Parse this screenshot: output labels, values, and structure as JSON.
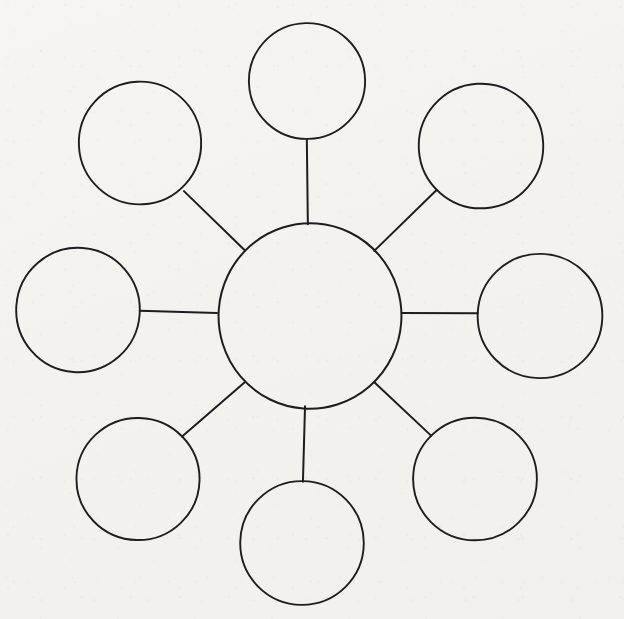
{
  "document": {
    "title": "Bubble Map Diagram",
    "kind": "hand-drawn bubble map",
    "medium": "ink on paper",
    "canvas_width": 624,
    "canvas_height": 619,
    "background_color": "#f4f3f0",
    "ink_color": "#1d1d1f",
    "node_count": 9,
    "link_count": 8,
    "all_nodes_empty": true
  },
  "chart_data": {
    "type": "diagram",
    "layout": "radial hub-and-spoke",
    "title": "",
    "center_node": {
      "id": "center",
      "label": "",
      "cx": 310,
      "cy": 316,
      "r": 92,
      "stroke_width": 2.0
    },
    "satellite_nodes": [
      {
        "id": "top",
        "label": "",
        "cx": 307,
        "cy": 81,
        "r": 58,
        "stroke_width": 1.9,
        "angle_deg": 90
      },
      {
        "id": "upper-right",
        "label": "",
        "cx": 481,
        "cy": 146,
        "r": 62,
        "stroke_width": 1.9,
        "angle_deg": 45
      },
      {
        "id": "right",
        "label": "",
        "cx": 540,
        "cy": 316,
        "r": 62,
        "stroke_width": 1.9,
        "angle_deg": 0
      },
      {
        "id": "lower-right",
        "label": "",
        "cx": 475,
        "cy": 479,
        "r": 62,
        "stroke_width": 1.9,
        "angle_deg": -45
      },
      {
        "id": "bottom",
        "label": "",
        "cx": 302,
        "cy": 543,
        "r": 62,
        "stroke_width": 1.9,
        "angle_deg": -90
      },
      {
        "id": "lower-left",
        "label": "",
        "cx": 138,
        "cy": 479,
        "r": 61,
        "stroke_width": 1.9,
        "angle_deg": -135
      },
      {
        "id": "left",
        "label": "",
        "cx": 78,
        "cy": 310,
        "r": 62,
        "stroke_width": 1.9,
        "angle_deg": 180
      },
      {
        "id": "upper-left",
        "label": "",
        "cx": 140,
        "cy": 143,
        "r": 61,
        "stroke_width": 1.9,
        "angle_deg": 135
      }
    ],
    "links": [
      {
        "id": "link-top",
        "from": "center",
        "to": "top",
        "x1": 308,
        "y1": 224,
        "x2": 307,
        "y2": 140,
        "stroke_width": 2.0
      },
      {
        "id": "link-upper-right",
        "from": "center",
        "to": "upper-right",
        "x1": 374,
        "y1": 251,
        "x2": 437,
        "y2": 190,
        "stroke_width": 2.0
      },
      {
        "id": "link-right",
        "from": "center",
        "to": "right",
        "x1": 402,
        "y1": 313,
        "x2": 478,
        "y2": 313,
        "stroke_width": 2.0
      },
      {
        "id": "link-lower-right",
        "from": "center",
        "to": "lower-right",
        "x1": 374,
        "y1": 382,
        "x2": 431,
        "y2": 436,
        "stroke_width": 2.0
      },
      {
        "id": "link-bottom",
        "from": "center",
        "to": "bottom",
        "x1": 305,
        "y1": 406,
        "x2": 303,
        "y2": 482,
        "stroke_width": 2.0
      },
      {
        "id": "link-lower-left",
        "from": "center",
        "to": "lower-left",
        "x1": 245,
        "y1": 382,
        "x2": 182,
        "y2": 437,
        "stroke_width": 2.0
      },
      {
        "id": "link-left",
        "from": "center",
        "to": "left",
        "x1": 217,
        "y1": 313,
        "x2": 140,
        "y2": 311,
        "stroke_width": 2.0
      },
      {
        "id": "link-upper-left",
        "from": "center",
        "to": "upper-left",
        "x1": 245,
        "y1": 250,
        "x2": 184,
        "y2": 191,
        "stroke_width": 2.0
      }
    ],
    "xlim": [
      0,
      624
    ],
    "ylim": [
      0,
      619
    ],
    "grid": false,
    "legend": null,
    "annotations": []
  }
}
